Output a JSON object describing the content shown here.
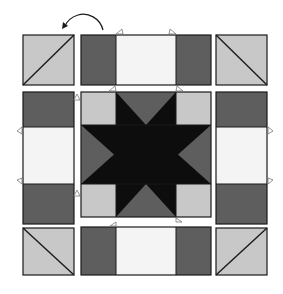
{
  "diagram": {
    "type": "quilt-block-assembly",
    "colors": {
      "background": "#ffffff",
      "outline": "#1a1a1a",
      "light_gray": "#c8c8c8",
      "medium_gray": "#5e5e5e",
      "dark": "#0d0d0d",
      "white_fabric": "#f4f4f4",
      "notch_stroke": "#777777"
    },
    "rotation_arrow": {
      "icon": "curved-arrow-counterclockwise",
      "target": "top-left-unit"
    },
    "rows": [
      {
        "name": "top-row",
        "units": [
          {
            "name": "hst-top-left",
            "kind": "half-square-triangle",
            "diagonal": "bottom-left-to-top-right"
          },
          {
            "name": "flying-bar-top",
            "kind": "three-strip-horizontal",
            "segments": [
              "dark",
              "white",
              "dark"
            ]
          },
          {
            "name": "hst-top-right",
            "kind": "half-square-triangle",
            "diagonal": "top-left-to-bottom-right"
          }
        ]
      },
      {
        "name": "middle-row",
        "units": [
          {
            "name": "bar-left",
            "kind": "three-strip-vertical",
            "segments": [
              "dark",
              "white",
              "dark"
            ]
          },
          {
            "name": "star-center",
            "kind": "sawtooth-star"
          },
          {
            "name": "bar-right",
            "kind": "three-strip-vertical",
            "segments": [
              "dark",
              "white",
              "dark"
            ]
          }
        ]
      },
      {
        "name": "bottom-row",
        "units": [
          {
            "name": "hst-bottom-left",
            "kind": "half-square-triangle",
            "diagonal": "top-left-to-bottom-right"
          },
          {
            "name": "flying-bar-bottom",
            "kind": "three-strip-horizontal",
            "segments": [
              "dark",
              "white",
              "dark"
            ]
          },
          {
            "name": "hst-bottom-right",
            "kind": "half-square-triangle",
            "diagonal": "bottom-left-to-top-right"
          }
        ]
      }
    ],
    "seam_notches": 12
  }
}
